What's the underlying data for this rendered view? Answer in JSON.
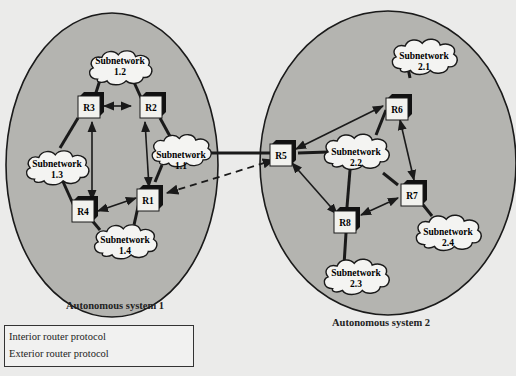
{
  "diagram": {
    "type": "network-topology",
    "colors": {
      "page_bg": "#ebebea",
      "as_fill": "#b4b4b0",
      "outline": "#1a1a1a",
      "cloud_fill": "#f4f4f2",
      "router_fill": "#f2f2ee",
      "router_shadow": "#111111"
    },
    "autonomous_systems": [
      {
        "id": "AS1",
        "label": "Autonomous system 1"
      },
      {
        "id": "AS2",
        "label": "Autonomous system 2"
      }
    ],
    "routers": [
      {
        "id": "R1",
        "label": "R1",
        "as": "AS1"
      },
      {
        "id": "R2",
        "label": "R2",
        "as": "AS1"
      },
      {
        "id": "R3",
        "label": "R3",
        "as": "AS1"
      },
      {
        "id": "R4",
        "label": "R4",
        "as": "AS1"
      },
      {
        "id": "R5",
        "label": "R5",
        "as": "AS2"
      },
      {
        "id": "R6",
        "label": "R6",
        "as": "AS2"
      },
      {
        "id": "R7",
        "label": "R7",
        "as": "AS2"
      },
      {
        "id": "R8",
        "label": "R8",
        "as": "AS2"
      }
    ],
    "subnetworks": [
      {
        "id": "1.1",
        "line1": "Subnetwork",
        "line2": "1.1"
      },
      {
        "id": "1.2",
        "line1": "Subnetwork",
        "line2": "1.2"
      },
      {
        "id": "1.3",
        "line1": "Subnetwork",
        "line2": "1.3"
      },
      {
        "id": "1.4",
        "line1": "Subnetwork",
        "line2": "1.4"
      },
      {
        "id": "2.1",
        "line1": "Subnetwork",
        "line2": "2.1"
      },
      {
        "id": "2.2",
        "line1": "Subnetwork",
        "line2": "2.2"
      },
      {
        "id": "2.3",
        "line1": "Subnetwork",
        "line2": "2.3"
      },
      {
        "id": "2.4",
        "line1": "Subnetwork",
        "line2": "2.4"
      }
    ],
    "links": {
      "interior_protocol": [
        [
          "R3",
          "R2"
        ],
        [
          "R3",
          "R4"
        ],
        [
          "R2",
          "R1"
        ],
        [
          "R4",
          "R1"
        ],
        [
          "R5",
          "R6"
        ],
        [
          "R5",
          "R8"
        ],
        [
          "R6",
          "R7"
        ],
        [
          "R8",
          "R7"
        ]
      ],
      "exterior_protocol": [
        [
          "R1",
          "R5"
        ]
      ],
      "physical": [
        [
          "1.2",
          "R3"
        ],
        [
          "1.2",
          "R2"
        ],
        [
          "1.1",
          "R2"
        ],
        [
          "1.1",
          "R1"
        ],
        [
          "1.1",
          "R5"
        ],
        [
          "1.3",
          "R3"
        ],
        [
          "1.3",
          "R4"
        ],
        [
          "1.4",
          "R4"
        ],
        [
          "1.4",
          "R1"
        ],
        [
          "2.1",
          "R6"
        ],
        [
          "2.2",
          "R5"
        ],
        [
          "2.2",
          "R6"
        ],
        [
          "2.2",
          "R7"
        ],
        [
          "2.2",
          "R8"
        ],
        [
          "2.3",
          "R8"
        ],
        [
          "2.4",
          "R7"
        ]
      ]
    },
    "legend": {
      "items": [
        {
          "label": "Interior router protocol",
          "style": "solid-double-arrow"
        },
        {
          "label": "Exterior router protocol",
          "style": "dashed-double-arrow"
        }
      ]
    }
  }
}
